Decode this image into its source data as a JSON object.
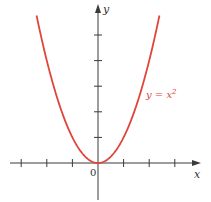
{
  "chart_data": {
    "type": "line",
    "title": "",
    "xlabel": "x",
    "ylabel": "y",
    "origin_label": "0",
    "series": [
      {
        "name": "y = x^2",
        "label_text": "y = x",
        "label_superscript": "2",
        "color": "#e0453a",
        "x": [
          -2.4,
          -2,
          -1.5,
          -1,
          -0.5,
          0,
          0.5,
          1,
          1.5,
          2,
          2.4
        ],
        "y": [
          5.76,
          4,
          2.25,
          1,
          0.25,
          0,
          0.25,
          1,
          2.25,
          4,
          5.76
        ]
      }
    ],
    "x_ticks": [
      -3,
      -2,
      -1,
      1,
      2,
      3
    ],
    "y_ticks": [
      1,
      2,
      3,
      4,
      5
    ],
    "xlim": [
      -3.0,
      3.7
    ],
    "ylim": [
      -1.5,
      6.2
    ],
    "grid": false,
    "legend": "inline label near curve"
  },
  "style": {
    "axis_color": "#3a3a3a",
    "curve_color": "#e0453a"
  }
}
